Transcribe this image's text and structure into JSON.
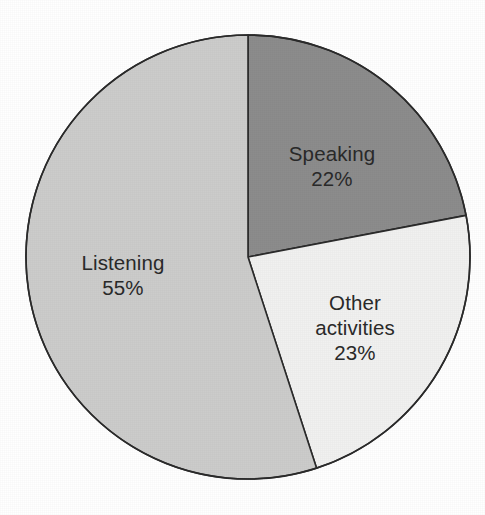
{
  "chart_data": {
    "type": "pie",
    "title": "",
    "subtitle": "",
    "xlabel": "",
    "ylabel": "",
    "legend": "none",
    "grid": false,
    "total_percent": 100,
    "start_angle_deg": 0,
    "direction": "clockwise",
    "categories": [
      "Speaking",
      "Other activities",
      "Listening"
    ],
    "values": [
      22,
      23,
      55
    ],
    "slices": [
      {
        "label": "Speaking",
        "value_label": "22%",
        "value": 22,
        "color": "#8c8c8c",
        "start_deg": 0,
        "end_deg": 79.2,
        "label_x": 332,
        "label_y": 166,
        "label_lines": [
          "Speaking"
        ]
      },
      {
        "label": "Other activities",
        "value_label": "23%",
        "value": 23,
        "color": "#f1f1f0",
        "start_deg": 79.2,
        "end_deg": 162.0,
        "label_x": 355,
        "label_y": 327,
        "label_lines": [
          "Other",
          "activities"
        ]
      },
      {
        "label": "Listening",
        "value_label": "55%",
        "value": 55,
        "color": "#cccccb",
        "start_deg": 162.0,
        "end_deg": 360.0,
        "label_x": 123,
        "label_y": 275,
        "label_lines": [
          "Listening"
        ]
      }
    ],
    "geometry": {
      "center_x": 248,
      "center_y": 257,
      "radius": 222
    },
    "colors": {
      "background": "#ffffff",
      "outline": "#2b2b2b",
      "text": "#2a2a2a"
    }
  }
}
